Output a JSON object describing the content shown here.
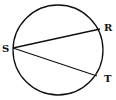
{
  "diagram": {
    "type": "circle-with-chords",
    "stroke_color": "#111111",
    "background": "#ffffff",
    "circle": {
      "cx": 58,
      "cy": 50,
      "r": 45
    },
    "points": [
      {
        "name": "S",
        "x": 13,
        "y": 48,
        "label_x": 2,
        "label_y": 52
      },
      {
        "name": "R",
        "x": 100,
        "y": 29,
        "label_x": 104,
        "label_y": 30
      },
      {
        "name": "T",
        "x": 97,
        "y": 76,
        "label_x": 104,
        "label_y": 82
      }
    ],
    "chords": [
      {
        "from": "S",
        "to": "R"
      },
      {
        "from": "S",
        "to": "T"
      }
    ],
    "labels": {
      "S": "S",
      "R": "R",
      "T": "T"
    }
  }
}
